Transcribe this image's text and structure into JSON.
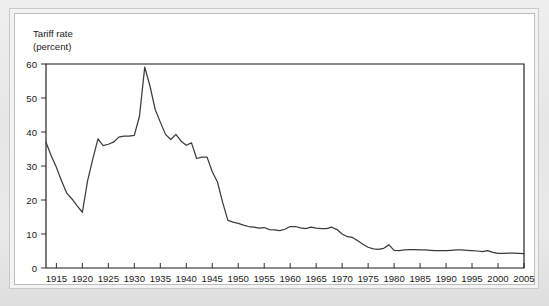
{
  "figure": {
    "panel_background": "#ffffff",
    "outer_background": "#e8e8e8",
    "axis_color": "#1a1a1a",
    "line_color": "#3b3b3b"
  },
  "chart_data": {
    "type": "line",
    "title": "",
    "subtitle": "",
    "ylabel_line1": "Tariff rate",
    "ylabel_line2": "(percent)",
    "xlabel": "",
    "ylabel": "Tariff rate (percent)",
    "grid": false,
    "legend_position": "none",
    "xlim": [
      1913,
      2005
    ],
    "ylim": [
      0,
      60
    ],
    "ytick_labels": [
      "60",
      "50",
      "40",
      "30",
      "20",
      "10",
      "0"
    ],
    "yticks": [
      60,
      50,
      40,
      30,
      20,
      10,
      0
    ],
    "xtick_labels": [
      "1915",
      "1920",
      "1925",
      "1930",
      "1935",
      "1940",
      "1945",
      "1950",
      "1955",
      "1960",
      "1965",
      "1970",
      "1975",
      "1980",
      "1985",
      "1990",
      "1995",
      "2000",
      "2005"
    ],
    "xticks": [
      1915,
      1920,
      1925,
      1930,
      1935,
      1940,
      1945,
      1950,
      1955,
      1960,
      1965,
      1970,
      1975,
      1980,
      1985,
      1990,
      1995,
      2000,
      2005
    ],
    "series": [
      {
        "name": "Tariff rate",
        "x": [
          1913,
          1914,
          1915,
          1916,
          1917,
          1918,
          1919,
          1920,
          1921,
          1922,
          1923,
          1924,
          1925,
          1926,
          1927,
          1928,
          1929,
          1930,
          1931,
          1932,
          1933,
          1934,
          1935,
          1936,
          1937,
          1938,
          1939,
          1940,
          1941,
          1942,
          1943,
          1944,
          1945,
          1946,
          1947,
          1948,
          1949,
          1950,
          1951,
          1952,
          1953,
          1954,
          1955,
          1956,
          1957,
          1958,
          1959,
          1960,
          1961,
          1962,
          1963,
          1964,
          1965,
          1966,
          1967,
          1968,
          1969,
          1970,
          1971,
          1972,
          1973,
          1974,
          1975,
          1976,
          1977,
          1978,
          1979,
          1980,
          1981,
          1982,
          1983,
          1984,
          1985,
          1986,
          1987,
          1988,
          1989,
          1990,
          1991,
          1992,
          1993,
          1994,
          1995,
          1996,
          1997,
          1998,
          1999,
          2000,
          2001,
          2002,
          2003,
          2004,
          2005
        ],
        "y": [
          37.0,
          33.0,
          29.6,
          25.6,
          22.0,
          20.3,
          18.3,
          16.4,
          25.6,
          32.0,
          38.0,
          36.0,
          36.4,
          37.0,
          38.5,
          38.8,
          38.8,
          39.0,
          44.7,
          59.1,
          53.6,
          46.7,
          42.9,
          39.3,
          37.8,
          39.3,
          37.3,
          36.1,
          36.8,
          32.2,
          32.6,
          32.6,
          28.3,
          25.3,
          19.3,
          14.0,
          13.5,
          13.1,
          12.6,
          12.2,
          12.0,
          11.7,
          11.9,
          11.3,
          11.2,
          11.0,
          11.4,
          12.2,
          12.2,
          11.8,
          11.6,
          12.0,
          11.7,
          11.6,
          11.6,
          12.0,
          11.3,
          10.0,
          9.2,
          9.0,
          8.0,
          7.0,
          6.1,
          5.6,
          5.5,
          5.8,
          6.8,
          5.2,
          5.1,
          5.3,
          5.4,
          5.4,
          5.3,
          5.3,
          5.2,
          5.1,
          5.1,
          5.1,
          5.2,
          5.3,
          5.3,
          5.2,
          5.1,
          5.0,
          4.8,
          5.1,
          4.6,
          4.3,
          4.3,
          4.4,
          4.4,
          4.3,
          4.2
        ]
      }
    ]
  }
}
